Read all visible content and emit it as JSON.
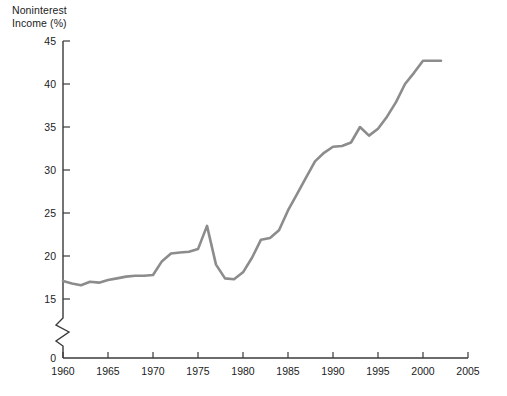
{
  "chart_data": {
    "type": "line",
    "title_line1": "Noninterest",
    "title_line2": "Income (%)",
    "xlabel": "",
    "ylabel": "Noninterest Income (%)",
    "xlim": [
      1960,
      2005
    ],
    "ylim": [
      15,
      45
    ],
    "y_axis_break": true,
    "y_break_from": 0,
    "y_break_to": 15,
    "grid": false,
    "legend": null,
    "line_color": "#8c8c8c",
    "axis_color": "#3a3a3a",
    "background_color": "#ffffff",
    "yticks": [
      0,
      15,
      20,
      25,
      30,
      35,
      40,
      45
    ],
    "ytick_labels": [
      "0",
      "15",
      "20",
      "25",
      "30",
      "35",
      "40",
      "45"
    ],
    "xticks": [
      1960,
      1965,
      1970,
      1975,
      1980,
      1985,
      1990,
      1995,
      2000,
      2005
    ],
    "xtick_labels": [
      "1960",
      "1965",
      "1970",
      "1975",
      "1980",
      "1985",
      "1990",
      "1995",
      "2000",
      "2005"
    ],
    "series": [
      {
        "name": "Noninterest Income",
        "x": [
          1960,
          1961,
          1962,
          1963,
          1964,
          1965,
          1966,
          1967,
          1968,
          1969,
          1970,
          1971,
          1972,
          1973,
          1974,
          1975,
          1976,
          1977,
          1978,
          1979,
          1980,
          1981,
          1982,
          1983,
          1984,
          1985,
          1986,
          1987,
          1988,
          1989,
          1990,
          1991,
          1992,
          1993,
          1994,
          1995,
          1996,
          1997,
          1998,
          1999,
          2000,
          2001,
          2002
        ],
        "values": [
          17.1,
          16.8,
          16.6,
          17.0,
          16.9,
          17.2,
          17.4,
          17.6,
          17.7,
          17.7,
          17.8,
          19.4,
          20.3,
          20.4,
          20.5,
          20.8,
          23.5,
          19.0,
          17.4,
          17.3,
          18.1,
          19.8,
          21.9,
          22.1,
          23.0,
          25.3,
          27.2,
          29.1,
          31.0,
          32.0,
          32.7,
          32.8,
          33.2,
          35.0,
          34.0,
          34.8,
          36.2,
          37.9,
          40.0,
          41.3,
          42.7,
          42.7,
          42.7
        ]
      }
    ]
  }
}
